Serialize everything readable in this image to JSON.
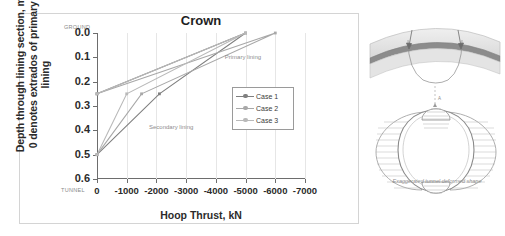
{
  "chart_data": {
    "type": "line",
    "title": "Crown",
    "xlabel": "Hoop Thrust, kN",
    "ylabel": "Depth through lining section, m 0 denotes extrados of primary lining",
    "ylabel_line1": "Depth through lining section, m",
    "ylabel_line2": "0 denotes extrados of primary",
    "ylabel_line3": "lining",
    "xlim": [
      0,
      -7000
    ],
    "ylim": [
      0.0,
      0.6
    ],
    "y_inverted": true,
    "grid": "vertical",
    "legend_position": "center-right",
    "xticks": [
      0,
      -1000,
      -2000,
      -3000,
      -4000,
      -5000,
      -6000,
      -7000
    ],
    "xtick_labels": [
      "0",
      "-1000",
      "-2000",
      "-3000",
      "-4000",
      "-5000",
      "-6000",
      "-7000"
    ],
    "yticks": [
      0.0,
      0.1,
      0.2,
      0.3,
      0.4,
      0.5,
      0.6
    ],
    "ytick_labels": [
      "0.0",
      "0.1",
      "0.2",
      "0.3",
      "0.4",
      "0.5",
      "0.6"
    ],
    "axis_end_labels": {
      "top": "GROUND",
      "bottom": "TUNNEL"
    },
    "annotations": [
      {
        "text": "Primary lining",
        "x": -4300,
        "y": 0.085
      },
      {
        "text": "Secondary lining",
        "x": -1750,
        "y": 0.375
      }
    ],
    "series": [
      {
        "name": "Case 1",
        "color": "#7f7f7f",
        "points": [
          {
            "x": 0,
            "y": 0.25
          },
          {
            "x": -5000,
            "y": 0.0
          },
          {
            "x": -2100,
            "y": 0.25
          },
          {
            "x": 0,
            "y": 0.5
          }
        ]
      },
      {
        "name": "Case 2",
        "color": "#a8a8a8",
        "points": [
          {
            "x": 0,
            "y": 0.25
          },
          {
            "x": -6000,
            "y": 0.0
          },
          {
            "x": -1500,
            "y": 0.25
          },
          {
            "x": 0,
            "y": 0.5
          }
        ]
      },
      {
        "name": "Case 3",
        "color": "#b9b9b9",
        "points": [
          {
            "x": 0,
            "y": 0.25
          },
          {
            "x": -5000,
            "y": 0.0
          },
          {
            "x": -1000,
            "y": 0.25
          },
          {
            "x": 0,
            "y": 0.5
          }
        ]
      }
    ],
    "legend_entries": [
      "Case 1",
      "Case 2",
      "Case 3"
    ]
  },
  "diagram": {
    "caption": "Exaggerated tunnel deformed shape",
    "crown_marker": "A"
  }
}
